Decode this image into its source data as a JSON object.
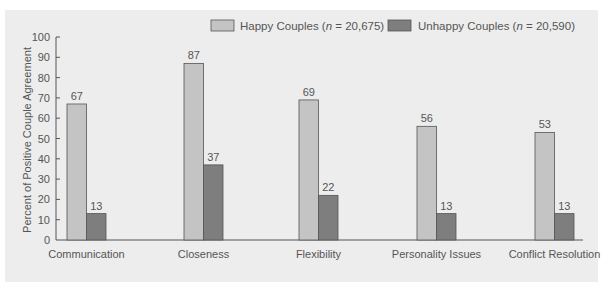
{
  "chart_data": {
    "type": "bar",
    "title": "",
    "xlabel": "",
    "ylabel": "Percent of Positive Couple Agreement",
    "ylim": [
      0,
      100
    ],
    "yticks": [
      0,
      10,
      20,
      30,
      40,
      50,
      60,
      70,
      80,
      90,
      100
    ],
    "grid": false,
    "legend_position": "top-right",
    "categories": [
      "Communication",
      "Closeness",
      "Flexibility",
      "Personality Issues",
      "Conflict Resolution"
    ],
    "series": [
      {
        "name": "Happy Couples",
        "n_label": "n",
        "n_value": "20,675",
        "color": "#c4c4c4",
        "values": [
          67,
          87,
          69,
          56,
          53
        ]
      },
      {
        "name": "Unhappy Couples",
        "n_label": "n",
        "n_value": "20,590",
        "color": "#7e7e7e",
        "values": [
          13,
          37,
          22,
          13,
          13
        ]
      }
    ]
  },
  "legend": {
    "items": [
      {
        "prefix": "Happy Couples (",
        "italic": "n",
        "suffix": " = 20,675)"
      },
      {
        "prefix": "Unhappy Couples (",
        "italic": "n",
        "suffix": " = 20,590)"
      }
    ]
  },
  "colors": {
    "panel": "#ededed",
    "axis": "#555555",
    "outline": "#555555",
    "text": "#555555"
  }
}
